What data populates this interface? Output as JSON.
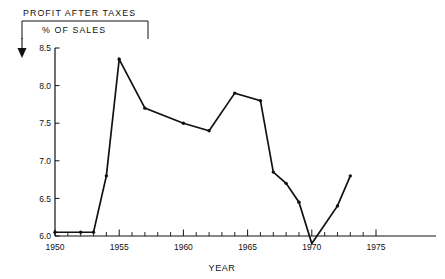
{
  "chart_data": {
    "type": "line",
    "title": "PROFIT AFTER TAXES",
    "subtitle": "% OF SALES",
    "xlabel": "YEAR",
    "ylabel": "",
    "xlim": [
      1950,
      1975
    ],
    "ylim": [
      6.0,
      8.5
    ],
    "grid": false,
    "legend": "none",
    "x_ticks": [
      1950,
      1955,
      1960,
      1965,
      1970,
      1975
    ],
    "x_tick_labels": [
      "1950",
      "1955",
      "1960",
      "1965",
      "1970",
      "1975"
    ],
    "x_minor_tick_step": 1,
    "y_ticks": [
      6.0,
      6.5,
      7.0,
      7.5,
      8.0,
      8.5
    ],
    "y_tick_labels": [
      "6.0",
      "6.5",
      "7.0",
      "7.5",
      "8.0",
      "8.5"
    ],
    "series": [
      {
        "name": "Profit after taxes, % of sales",
        "x": [
          1950,
          1952,
          1953,
          1954,
          1955,
          1957,
          1960,
          1962,
          1964,
          1966,
          1967,
          1968,
          1969,
          1970,
          1972,
          1973
        ],
        "values": [
          6.05,
          6.05,
          6.05,
          6.8,
          8.35,
          7.7,
          7.5,
          7.4,
          7.9,
          7.8,
          6.85,
          6.7,
          6.45,
          5.9,
          6.4,
          6.8
        ],
        "color": "#111111",
        "marker": "dot"
      }
    ]
  },
  "annotations": {
    "arrow_icon": "down-arrow-icon"
  }
}
